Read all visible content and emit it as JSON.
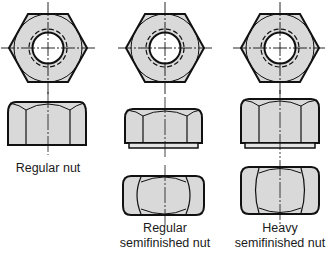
{
  "diagram": {
    "colors": {
      "fill": "#d9d9d9",
      "stroke": "#111111",
      "background": "#ffffff"
    },
    "nuts": [
      {
        "id": "regular-nut",
        "label_lines": [
          "Regular nut"
        ],
        "views": [
          "top-hex",
          "side-chamfered-top"
        ]
      },
      {
        "id": "regular-semifinished-nut",
        "label_lines": [
          "Regular",
          "semifinished nut"
        ],
        "views": [
          "top-hex",
          "side-with-washer-face",
          "side-double-chamfered"
        ]
      },
      {
        "id": "heavy-semifinished-nut",
        "label_lines": [
          "Heavy",
          "semifinished nut"
        ],
        "views": [
          "top-hex",
          "side-with-washer-face",
          "side-double-chamfered"
        ]
      }
    ]
  }
}
